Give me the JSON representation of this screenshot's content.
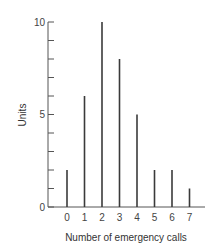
{
  "chart_data": {
    "type": "bar",
    "title": "",
    "xlabel": "Number of emergency calls",
    "ylabel": "Units",
    "categories": [
      "0",
      "1",
      "2",
      "3",
      "4",
      "5",
      "6",
      "7"
    ],
    "values": [
      2,
      6,
      10,
      8,
      5,
      2,
      2,
      1
    ],
    "ylim": [
      0,
      10
    ],
    "yticks_labeled": [
      0,
      5,
      10
    ],
    "yticks_minor_step": 1,
    "grid": false,
    "legend": null,
    "style": "spike/line bars"
  },
  "colors": {
    "bar": "#3a3a3a",
    "axis": "#555555",
    "text": "#444444"
  }
}
